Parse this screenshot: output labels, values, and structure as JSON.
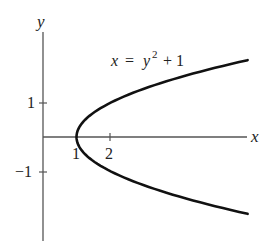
{
  "chart_data": {
    "type": "line",
    "title": "",
    "equation": {
      "lhs": "x",
      "eq": "=",
      "var": "y",
      "exp": "2",
      "rest": "+ 1"
    },
    "xlabel": "x",
    "ylabel": "y",
    "x_ticks": [
      {
        "value": 1,
        "label": "1"
      },
      {
        "value": 2,
        "label": "2"
      }
    ],
    "y_ticks": [
      {
        "value": 1,
        "label": "1"
      },
      {
        "value": -1,
        "label": "−1"
      }
    ],
    "xlim": [
      0,
      6.1
    ],
    "ylim": [
      -3.1,
      3.1
    ],
    "grid": false,
    "legend": "none",
    "series": [
      {
        "name": "x = y^2 + 1",
        "parametric_in": "y",
        "y": [
          -2.26,
          -2.0,
          -1.5,
          -1.0,
          -0.5,
          0.0,
          0.5,
          1.0,
          1.5,
          2.0,
          2.26
        ],
        "x": [
          6.1,
          5.0,
          3.25,
          2.0,
          1.25,
          1.0,
          1.25,
          2.0,
          3.25,
          5.0,
          6.1
        ]
      }
    ],
    "colors": {
      "curve": "#111111",
      "axes": "#444444",
      "text": "#222222"
    }
  }
}
